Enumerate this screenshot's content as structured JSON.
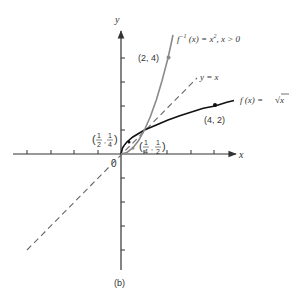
{
  "figure": {
    "caption": "(b)",
    "origin_label": "0",
    "x_axis_label": "x",
    "y_axis_label": "y"
  },
  "colors": {
    "background": "#ffffff",
    "axis": "#333333",
    "f_curve": "#111111",
    "f_inverse_curve": "#8a8a8a",
    "identity_line": "#666666"
  },
  "axes": {
    "x_ticks": [
      -4,
      -3,
      -2,
      -1,
      1,
      2,
      3,
      4
    ],
    "y_ticks": [
      -4,
      -3,
      -2,
      -1,
      1,
      2,
      3,
      4
    ],
    "x_range": [
      -4.6,
      4.9
    ],
    "y_range": [
      -4.8,
      5.2
    ]
  },
  "curves": {
    "f": {
      "label_prefix": "f (x) = ",
      "label_expr": "√x",
      "point": [
        4,
        2
      ],
      "point_label": "(4, 2)"
    },
    "f_inverse": {
      "label_prefix": "f",
      "label_sup": "−1",
      "label_suffix": " (x) = x",
      "label_power": "2",
      "label_condition": ", x > 0",
      "point": [
        2,
        4
      ],
      "point_label": "(2, 4)"
    },
    "identity": {
      "label": "y = x"
    }
  },
  "small_points": {
    "p1": {
      "num1": "1",
      "den1": "2",
      "num2": "1",
      "den2": "4"
    },
    "p2": {
      "num1": "1",
      "den1": "4",
      "num2": "1",
      "den2": "2"
    }
  }
}
